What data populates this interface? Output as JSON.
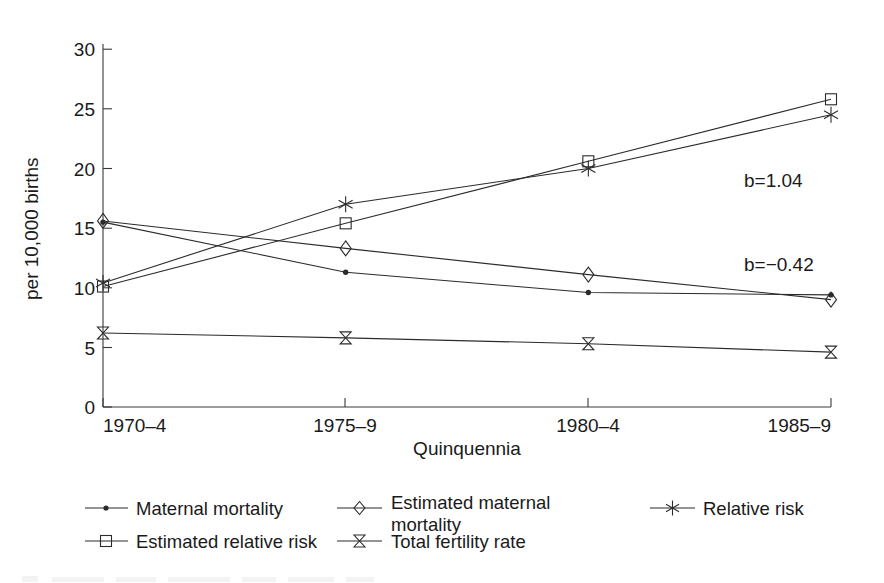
{
  "chart_data": {
    "type": "line",
    "title": "",
    "xlabel": "Quinquennia",
    "ylabel": "per 10,000 births",
    "categories": [
      "1970–4",
      "1975–9",
      "1980–4",
      "1985–9"
    ],
    "ylim": [
      0,
      30
    ],
    "yticks": [
      0,
      5,
      10,
      15,
      20,
      25,
      30
    ],
    "ytick_labels": [
      "0",
      "5",
      "10",
      "15",
      "20",
      "25",
      "30"
    ],
    "grid": false,
    "legend_position": "below",
    "series": [
      {
        "name": "Maternal mortality",
        "marker": "dot",
        "values": [
          15.5,
          11.3,
          9.6,
          9.4
        ]
      },
      {
        "name": "Estimated maternal mortality",
        "marker": "diamond",
        "values": [
          15.6,
          13.3,
          11.1,
          9.0
        ]
      },
      {
        "name": "Relative risk",
        "marker": "asterisk",
        "values": [
          10.4,
          17.0,
          20.0,
          24.5
        ]
      },
      {
        "name": "Estimated relative risk",
        "marker": "square",
        "values": [
          10.1,
          15.4,
          20.6,
          25.8
        ]
      },
      {
        "name": "Total fertility rate",
        "marker": "bowtie",
        "values": [
          6.2,
          5.8,
          5.3,
          4.6
        ]
      }
    ],
    "annotations": [
      {
        "text": "b=1.04",
        "x_frac": 0.88,
        "y_value": 19.3
      },
      {
        "text": "b=−0.42",
        "x_frac": 0.88,
        "y_value": 12.3
      }
    ]
  },
  "legend": {
    "entries": [
      {
        "label": "Maternal mortality",
        "marker": "dot"
      },
      {
        "label": "Estimated maternal",
        "label2": "mortality",
        "marker": "diamond"
      },
      {
        "label": "Relative risk",
        "marker": "asterisk"
      },
      {
        "label": "Estimated relative risk",
        "marker": "square"
      },
      {
        "label": "Total fertility rate",
        "marker": "bowtie"
      }
    ]
  },
  "colors": {
    "ink": "#2b2b2b",
    "axis": "#3a3a3a",
    "background": "#ffffff"
  }
}
